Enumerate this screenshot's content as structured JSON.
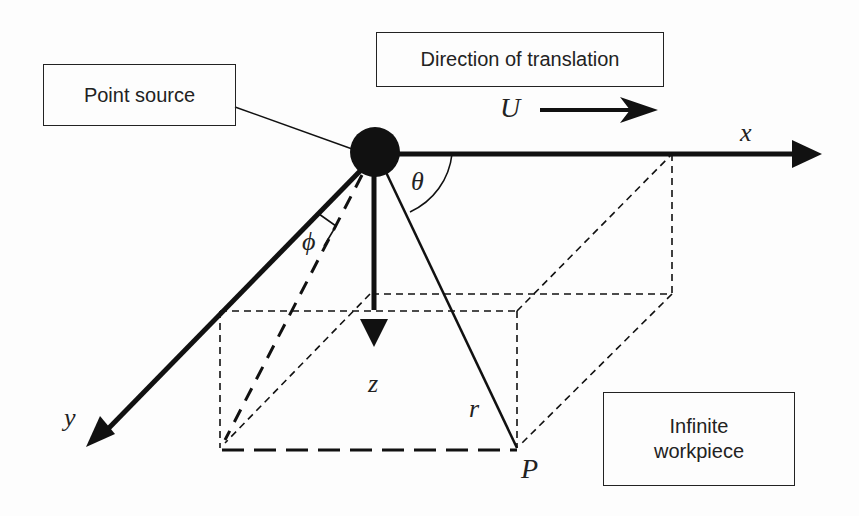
{
  "diagram": {
    "boxes": {
      "point_source": "Point source",
      "direction": "Direction of translation",
      "workpiece_line1": "Infinite",
      "workpiece_line2": "workpiece"
    },
    "labels": {
      "velocity": "U",
      "x_axis": "x",
      "y_axis": "y",
      "z_axis": "z",
      "theta": "θ",
      "phi": "ϕ",
      "radius": "r",
      "point": "P"
    },
    "colors": {
      "ink": "#111111",
      "background": "#fdfdfd"
    }
  }
}
